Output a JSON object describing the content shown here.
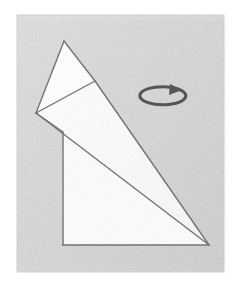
{
  "figure": {
    "title": "Origami folding step diagram",
    "caption": "Folded paper model with rotation indicator",
    "canvas": {
      "width": 242,
      "height": 291
    },
    "page_background": "#ffffff"
  },
  "panel": {
    "name": "textured-gray-panel",
    "x": 17,
    "y": 15,
    "width": 207,
    "height": 257,
    "fill": "#dcdcdc",
    "edge_shadow": "#cfcfcf",
    "texture": "subtle paper grain"
  },
  "model": {
    "name": "folded-paper-model",
    "fill": "#fdfdfd",
    "stroke": "#6b6b6b",
    "stroke_width": 1.4,
    "vertices": {
      "apex": {
        "label": "A",
        "x": 64,
        "y": 41
      },
      "left_corner": {
        "label": "B",
        "x": 36,
        "y": 113
      },
      "fold_vertex": {
        "label": "C",
        "x": 95,
        "y": 81
      },
      "right_point": {
        "label": "D",
        "x": 209,
        "y": 245
      },
      "base_left_top": {
        "label": "E",
        "x": 63,
        "y": 132
      },
      "base_left_bottom": {
        "label": "F",
        "x": 63,
        "y": 245
      }
    },
    "facets": [
      {
        "name": "upper-flap-triangle",
        "points": "64,41 95,81 36,113",
        "fill": "#ffffff"
      },
      {
        "name": "long-tapered-sail",
        "points": "36,113 95,81 209,245",
        "fill": "#fcfcfc"
      },
      {
        "name": "lower-body-quad",
        "points": "63,132 209,245 63,245",
        "fill": "#fdfdfd"
      },
      {
        "name": "left-spine-wedge",
        "points": "36,113 63,132 63,245 209,245",
        "fill": "#fdfdfd"
      }
    ],
    "fold_lines": [
      {
        "name": "crease-apex-to-fold",
        "x1": 64,
        "y1": 41,
        "x2": 95,
        "y2": 81
      },
      {
        "name": "crease-fold-to-left",
        "x1": 95,
        "y1": 81,
        "x2": 36,
        "y2": 113
      },
      {
        "name": "crease-left-to-apex",
        "x1": 36,
        "y1": 113,
        "x2": 64,
        "y2": 41
      },
      {
        "name": "edge-fold-to-point",
        "x1": 95,
        "y1": 81,
        "x2": 209,
        "y2": 245
      },
      {
        "name": "edge-left-to-point",
        "x1": 36,
        "y1": 113,
        "x2": 209,
        "y2": 245
      },
      {
        "name": "edge-base-left-vertical",
        "x1": 63,
        "y1": 132,
        "x2": 63,
        "y2": 245
      },
      {
        "name": "edge-base-bottom",
        "x1": 63,
        "y1": 245,
        "x2": 209,
        "y2": 245
      }
    ]
  },
  "rotation_indicator": {
    "name": "rotate-arrow-icon",
    "label": "rotate-model",
    "meaning": "turn the model over / rotate",
    "color": "#555555",
    "stroke_width": 3.0,
    "center_x": 166,
    "center_y": 97,
    "radius_x": 23,
    "radius_y": 9,
    "arrow_direction": "clockwise-right",
    "arrow_tip_x": 178,
    "arrow_tip_y": 89
  },
  "accessibility": {
    "figure_role": "Instructional origami diagram",
    "alt_text": "A white folded paper shape on a gray textured square, with a clockwise rotation arrow to the upper right."
  }
}
